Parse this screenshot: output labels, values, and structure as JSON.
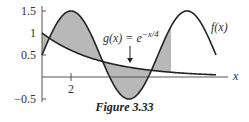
{
  "figure": {
    "caption": "Figure 3.33",
    "f_label": "f(x)",
    "g_label_prefix": "g(x) = e",
    "g_label_exponent": "−x/4",
    "x_axis_label": "x",
    "y_ticks": [
      "1.5",
      "1",
      "0.5",
      "−0.5"
    ],
    "x_ticks": [
      "2"
    ]
  },
  "chart_data": {
    "type": "line",
    "title": "Figure 3.33",
    "xlabel": "x",
    "ylabel": "",
    "xlim": [
      0,
      12
    ],
    "ylim": [
      -0.5,
      1.5
    ],
    "x_ticks": [
      2
    ],
    "y_ticks": [
      -0.5,
      0.5,
      1,
      1.5
    ],
    "grid": false,
    "series": [
      {
        "name": "f(x)",
        "formula": "0.5 + sin(pi*x/4)",
        "x": [
          0,
          1,
          2,
          3,
          4,
          5,
          6,
          7,
          8,
          9,
          10,
          11,
          12
        ],
        "values": [
          0.5,
          1.21,
          1.5,
          1.21,
          0.5,
          -0.21,
          -0.5,
          -0.21,
          0.5,
          1.21,
          1.5,
          1.21,
          0.5
        ]
      },
      {
        "name": "g(x) = e^(-x/4)",
        "formula": "exp(-x/4)",
        "x": [
          0,
          1,
          2,
          3,
          4,
          5,
          6,
          7,
          8,
          9,
          10,
          11,
          12
        ],
        "values": [
          1.0,
          0.78,
          0.61,
          0.47,
          0.37,
          0.29,
          0.22,
          0.17,
          0.14,
          0.11,
          0.08,
          0.06,
          0.05
        ]
      }
    ],
    "annotations": [
      "Shaded region between f(x) and g(x) from x=0 to about x=8.9",
      "Arrow pointing to g(x) curve labeled g(x) = e^(-x/4)"
    ]
  }
}
